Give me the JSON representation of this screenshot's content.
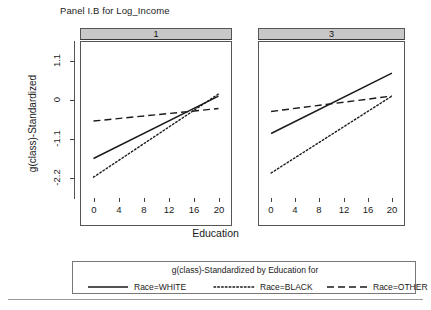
{
  "chart_data": {
    "type": "line",
    "title": "Panel I.B for Log_Income",
    "xlabel": "Education",
    "ylabel": "g(class)-Standardized",
    "xlim": [
      -2,
      22
    ],
    "ylim": [
      -2.75,
      1.65
    ],
    "x_ticks": [
      0,
      4,
      8,
      12,
      16,
      20
    ],
    "x_tick_labels": [
      "0",
      "4",
      "8",
      "12",
      "16",
      "20"
    ],
    "y_ticks": [
      1.1,
      0,
      -1.1,
      -2.2
    ],
    "y_tick_labels": [
      "1.1",
      "0",
      "-1.1",
      "-2.2"
    ],
    "grid": false,
    "legend_position": "bottom",
    "legend_title": "g(class)-Standardized by Education for",
    "panel_variable": "class",
    "panels": [
      {
        "label": "1",
        "series": [
          {
            "name": "Race=WHITE",
            "style": "solid",
            "x": [
              0,
              20
            ],
            "values": [
              -1.15,
              0.35
            ]
          },
          {
            "name": "Race=BLACK",
            "style": "dotted",
            "x": [
              0,
              20
            ],
            "values": [
              -1.6,
              0.4
            ]
          },
          {
            "name": "Race=OTHER",
            "style": "dashed",
            "x": [
              0,
              20
            ],
            "values": [
              -0.25,
              0.05
            ]
          }
        ]
      },
      {
        "label": "3",
        "series": [
          {
            "name": "Race=WHITE",
            "style": "solid",
            "x": [
              0,
              20
            ],
            "values": [
              -0.55,
              0.9
            ]
          },
          {
            "name": "Race=BLACK",
            "style": "dotted",
            "x": [
              0,
              20
            ],
            "values": [
              -1.5,
              0.35
            ]
          },
          {
            "name": "Race=OTHER",
            "style": "dashed",
            "x": [
              0,
              20
            ],
            "values": [
              -0.02,
              0.35
            ]
          }
        ]
      }
    ],
    "legend_entries": [
      {
        "label": "Race=WHITE",
        "style": "solid"
      },
      {
        "label": "Race=BLACK",
        "style": "dotted"
      },
      {
        "label": "Race=OTHER",
        "style": "dashed"
      }
    ],
    "colors": {
      "line": "#1a1a1a",
      "panel_header_fill": "#c8c8c8",
      "frame": "#555555",
      "background": "#ffffff"
    }
  }
}
